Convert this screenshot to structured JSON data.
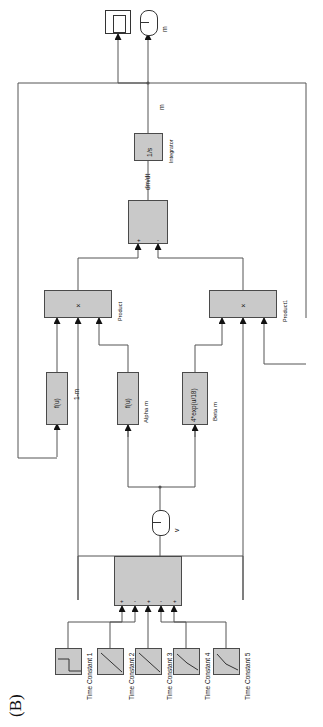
{
  "figure": {
    "panel_label": "(B)",
    "type": "simulink-block-diagram",
    "orientation": "rotated-90-clockwise"
  },
  "sinks": {
    "scope": {
      "name": "scope-block",
      "glyph": "scope"
    },
    "output_port": {
      "label": "m",
      "shape": "rounded-terminal"
    }
  },
  "integrator": {
    "expr": "1/s",
    "name_label": "Integrator",
    "output_signal": "m",
    "input_signal": "dm/dt"
  },
  "sum_top": {
    "name": "sum-block-top",
    "inputs": [
      "+",
      "-"
    ]
  },
  "products": [
    {
      "id": "product",
      "symbol": "×",
      "name_label": "Product",
      "inputs": 3
    },
    {
      "id": "product1",
      "symbol": "×",
      "name_label": "Product1",
      "inputs": 3
    }
  ],
  "signals": {
    "one_minus_m": "1-m",
    "m": "m",
    "dmdt": "dm/dt",
    "v": "v"
  },
  "fcn_blocks": [
    {
      "id": "fcn-ku",
      "expr": "f(u)",
      "name_label": ""
    },
    {
      "id": "fcn-alpha-m",
      "expr": "f(u)",
      "name_label": "Alpha m"
    },
    {
      "id": "fcn-beta-m",
      "expr": "4*exp(u/18)",
      "name_label": "Beta m"
    }
  ],
  "input_port": {
    "label": "v",
    "shape": "rounded-terminal"
  },
  "sum_bottom": {
    "name": "sum-block-bottom",
    "signs": [
      "+",
      "-",
      "+",
      "-",
      "+"
    ]
  },
  "time_constants": [
    {
      "label": "Time Constant 1",
      "glyph": "step"
    },
    {
      "label": "Time Constant 2",
      "glyph": "ramp-down"
    },
    {
      "label": "Time Constant 3",
      "glyph": "ramp-down"
    },
    {
      "label": "Time Constant 4",
      "glyph": "ramp-down"
    },
    {
      "label": "Time Constant 5",
      "glyph": "ramp-down"
    }
  ],
  "colors": {
    "block_fill": "#c9c9c9",
    "block_stroke": "#4a4a4a",
    "wire": "#555555",
    "background": "#ffffff"
  }
}
